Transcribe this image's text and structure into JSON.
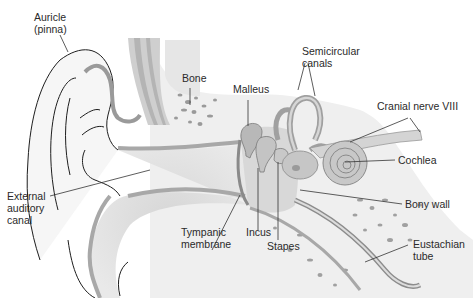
{
  "diagram": {
    "type": "anatomy",
    "colors": {
      "background": "#ffffff",
      "tissue_light": "#eeeeee",
      "tissue_mid": "#d9d9d9",
      "tissue_dark": "#bdbdbd",
      "outline": "#1e1e1e",
      "bone_speck": "#9a9a9a",
      "text": "#2a2a2a"
    },
    "labels": {
      "auricle": {
        "line1": "Auricle",
        "line2": "(pinna)"
      },
      "bone": {
        "line1": "Bone"
      },
      "malleus": {
        "line1": "Malleus"
      },
      "semicircular": {
        "line1": "Semicircular",
        "line2": "canals"
      },
      "cranial_nerve": {
        "line1": "Cranial nerve VIII"
      },
      "cochlea": {
        "line1": "Cochlea"
      },
      "external_canal": {
        "line1": "External",
        "line2": "auditory",
        "line3": "canal"
      },
      "bony_wall": {
        "line1": "Bony wall"
      },
      "tympanic": {
        "line1": "Tympanic",
        "line2": "membrane"
      },
      "incus": {
        "line1": "Incus"
      },
      "stapes": {
        "line1": "Stapes"
      },
      "eustachian": {
        "line1": "Eustachian",
        "line2": "tube"
      }
    }
  }
}
